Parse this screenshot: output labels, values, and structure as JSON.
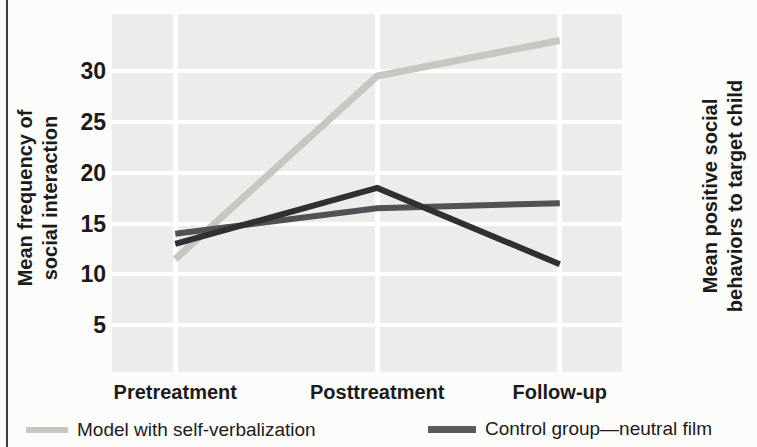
{
  "figure": {
    "left_axis_label": {
      "line1": "Mean frequency of",
      "line2": "social interaction"
    },
    "right_axis_label": {
      "line1": "Mean positive social",
      "line2": "behaviors to target child"
    }
  },
  "legend": {
    "items": [
      {
        "label": "Model with self-verbalization",
        "color": "#c6c7c1"
      },
      {
        "label": "Control group—neutral film",
        "color": "#595a5d"
      }
    ]
  },
  "chart_data": {
    "type": "line",
    "categories": [
      "Pretreatment",
      "Posttreatment",
      "Follow-up"
    ],
    "series": [
      {
        "name": "Model with self-verbalization",
        "color": "#c6c7c1",
        "values": [
          11.5,
          29.5,
          33
        ]
      },
      {
        "name": "Control group—neutral film",
        "color": "#515256",
        "values": [
          14,
          16.5,
          17
        ]
      },
      {
        "name": "unlabeled dark line (legend entry not visible)",
        "color": "#2f3031",
        "values": [
          13,
          18.5,
          11
        ]
      }
    ],
    "ylabel": "Mean frequency of social interaction",
    "right_ylabel": "Mean positive social behaviors to target child",
    "xlabel": "",
    "y_ticks": [
      5,
      10,
      15,
      20,
      25,
      30
    ],
    "ylim": [
      0.4,
      35.6
    ],
    "x_fractions": [
      0.124,
      0.52,
      0.878
    ],
    "grid": true,
    "panel_bg": "#ececea",
    "grid_color": "#ffffff",
    "legend_position": "bottom"
  }
}
